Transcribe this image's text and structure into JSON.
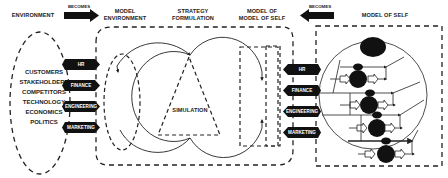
{
  "headers": {
    "environment": "ENVIRONMENT",
    "becomes_left": "BECOMES",
    "model_environment_1": "MODEL",
    "model_environment_2": "ENVIRONMENT",
    "strategy_1": "STRATEGY",
    "strategy_2": "FORMULATION",
    "model_of_model_1": "MODEL OF",
    "model_of_model_2": "MODEL OF SELF",
    "becomes_right": "BECOMES",
    "model_of_self": "MODEL OF SELF"
  },
  "environment_factors": [
    "CUSTOMERS",
    "STAKEHOLDERS",
    "COMPETITORS",
    "TECHNOLOGY",
    "ECONOMICS",
    "POLITICS"
  ],
  "left_tags": [
    "HR",
    "FINANCE",
    "ENGINEERING",
    "MARKETING"
  ],
  "right_tags": [
    "HR",
    "FINANCE",
    "ENGINEERING",
    "MARKETING"
  ],
  "simulation_label": "SIMULATION",
  "colors": {
    "ink": "#111111",
    "line": "#222222",
    "background": "#ffffff"
  }
}
